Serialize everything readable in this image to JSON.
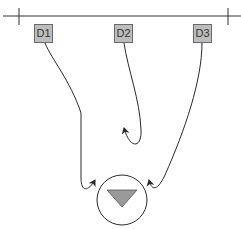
{
  "diagram": {
    "nodes": [
      {
        "id": "D1",
        "label": "D1"
      },
      {
        "id": "D2",
        "label": "D2"
      },
      {
        "id": "D3",
        "label": "D3"
      }
    ],
    "target": {
      "symbol": "downward-triangle-in-circle"
    },
    "edges": [
      {
        "from": "D1",
        "to": "target"
      },
      {
        "from": "D2",
        "to": "none",
        "note": "curves back, ends short of target"
      },
      {
        "from": "D3",
        "to": "target"
      }
    ],
    "colors": {
      "line": "#2a2a2a",
      "node_fill": "#bdbdbd",
      "triangle_fill": "#9a9a9a"
    }
  }
}
